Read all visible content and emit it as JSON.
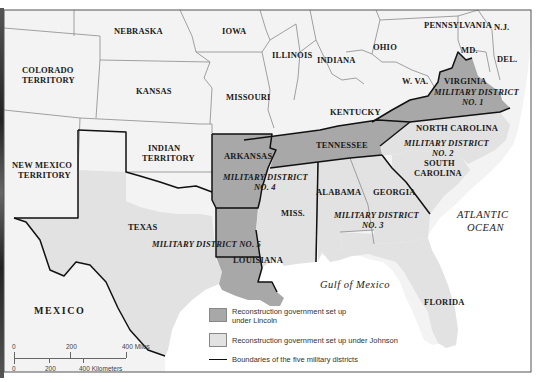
{
  "map": {
    "title": "Reconstruction Military Districts",
    "colors": {
      "water": "#ffffff",
      "other_states": "#f3f3f3",
      "lincoln": "#a8a8a8",
      "johnson": "#e2e2e2",
      "boundary": "#111111",
      "state_line": "#8a8a8a"
    },
    "states": {
      "nebraska": "NEBRASKA",
      "iowa": "IOWA",
      "colorado": "COLORADO\nTERRITORY",
      "colorado_l1": "COLORADO",
      "colorado_l2": "TERRITORY",
      "kansas": "KANSAS",
      "missouri": "MISSOURI",
      "illinois": "ILLINOIS",
      "indiana": "INDIANA",
      "ohio": "OHIO",
      "pennsylvania": "PENNSYLVANIA",
      "nj": "N.J.",
      "md": "MD.",
      "del": "DEL.",
      "wva": "W. VA.",
      "virginia": "VIRGINIA",
      "kentucky": "KENTUCKY",
      "north_carolina": "NORTH CAROLINA",
      "south_carolina_l1": "SOUTH",
      "south_carolina_l2": "CAROLINA",
      "tennessee": "TENNESSEE",
      "arkansas": "ARKANSAS",
      "indian_territory_l1": "INDIAN",
      "indian_territory_l2": "TERRITORY",
      "new_mexico_l1": "NEW MEXICO",
      "new_mexico_l2": "TERRITORY",
      "texas": "TEXAS",
      "louisiana": "LOUISIANA",
      "miss": "MISS.",
      "alabama": "ALABAMA",
      "georgia": "GEORGIA",
      "florida": "FLORIDA",
      "mexico": "MEXICO"
    },
    "districts": {
      "d1_l1": "MILITARY DISTRICT",
      "d1_l2": "NO. 1",
      "d2_l1": "MILITARY DISTRICT",
      "d2_l2": "NO. 2",
      "d3_l1": "MILITARY DISTRICT",
      "d3_l2": "NO. 3",
      "d4_l1": "MILITARY DISTRICT",
      "d4_l2": "NO. 4",
      "d5": "MILITARY DISTRICT NO. 5"
    },
    "water": {
      "atlantic_l1": "ATLANTIC",
      "atlantic_l2": "OCEAN",
      "gulf": "Gulf of Mexico"
    },
    "legend": {
      "items": [
        {
          "swatch": "lincoln",
          "label_l1": "Reconstruction government set up",
          "label_l2": "under Lincoln"
        },
        {
          "swatch": "johnson",
          "label_l1": "Reconstruction government set up under Johnson"
        },
        {
          "swatch": "line",
          "label_l1": "Boundaries of the five military districts"
        }
      ]
    },
    "scale": {
      "miles": [
        "0",
        "200",
        "400 Miles"
      ],
      "km": [
        "0",
        "200",
        "400 Kilometers"
      ]
    }
  }
}
